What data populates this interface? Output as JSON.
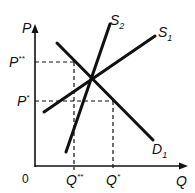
{
  "diagram": {
    "axes": {
      "y_label": "P",
      "x_label": "Q",
      "origin_label": "0"
    },
    "curves": [
      {
        "name": "S2",
        "label_main": "S",
        "label_sub": "2",
        "type": "supply"
      },
      {
        "name": "S1",
        "label_main": "S",
        "label_sub": "1",
        "type": "supply"
      },
      {
        "name": "D1",
        "label_main": "D",
        "label_sub": "1",
        "type": "demand"
      }
    ],
    "price_levels": [
      {
        "label": "P**",
        "main": "P",
        "sup": "**"
      },
      {
        "label": "P*",
        "main": "P",
        "sup": "*"
      }
    ],
    "quantity_levels": [
      {
        "label": "Q**",
        "main": "Q",
        "sup": "**"
      },
      {
        "label": "Q*",
        "main": "Q",
        "sup": "*"
      }
    ],
    "colors": {
      "line": "#111111",
      "background": "#ffffff"
    }
  }
}
